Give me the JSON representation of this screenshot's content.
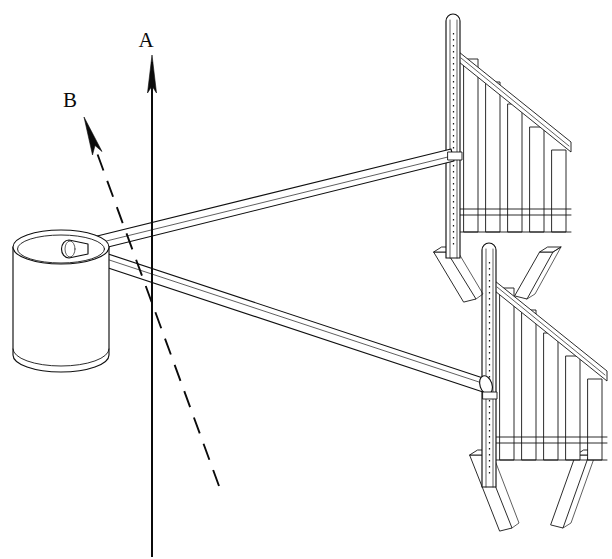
{
  "figure": {
    "background_color": "#ffffff",
    "line_color": "#101010",
    "canvas": {
      "width": 612,
      "height": 559
    }
  },
  "vectors": [
    {
      "id": "A",
      "label": "A",
      "style": "solid",
      "label_x": 152,
      "label_y": 44,
      "tail": {
        "x": 152,
        "y": 557
      },
      "tip": {
        "x": 152,
        "y": 55
      },
      "description": "vertical solid arrow pointing up"
    },
    {
      "id": "B",
      "label": "B",
      "style": "dashed",
      "label_x": 70,
      "label_y": 104,
      "tail": {
        "x": 219,
        "y": 486
      },
      "tip": {
        "x": 84,
        "y": 117
      },
      "description": "dashed arrow pointing up-left"
    }
  ],
  "parts": [
    {
      "name": "drum",
      "type": "cylinder",
      "center_x": 61,
      "top_y": 247,
      "bottom_y": 358,
      "radius_x": 48,
      "radius_y": 17
    },
    {
      "name": "upper-strut",
      "type": "rod",
      "from": {
        "x": 82,
        "y": 247
      },
      "to": {
        "x": 452,
        "y": 156
      }
    },
    {
      "name": "lower-strut",
      "type": "rod",
      "from": {
        "x": 79,
        "y": 251
      },
      "to": {
        "x": 488,
        "y": 386
      }
    },
    {
      "name": "upper-frame",
      "type": "slotted-upright-frame",
      "post_x": 453,
      "post_top_y": 14,
      "post_bottom_y": 258,
      "slat_count": 5,
      "foot_count": 2
    },
    {
      "name": "lower-frame",
      "type": "slotted-upright-frame",
      "post_x": 489,
      "post_top_y": 243,
      "post_bottom_y": 487,
      "slat_count": 5,
      "foot_count": 2
    }
  ],
  "corner_marks": {
    "top_left": "",
    "note": ""
  }
}
